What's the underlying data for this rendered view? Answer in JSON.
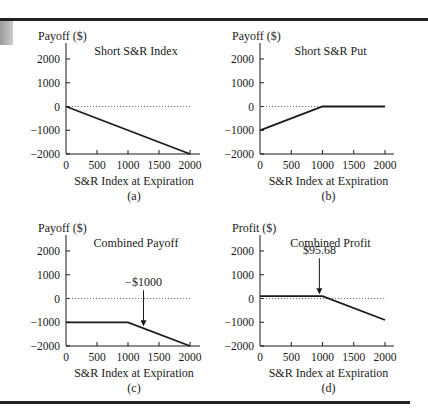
{
  "chart_data": [
    {
      "type": "line",
      "panel_label": "(a)",
      "title": "Short S&R Index",
      "ylabel": "Payoff ($)",
      "xlabel": "S&R Index at Expiration",
      "xlim": [
        0,
        2000
      ],
      "ylim": [
        -2000,
        2000
      ],
      "xticks": [
        0,
        500,
        1000,
        1500,
        2000
      ],
      "yticks": [
        2000,
        1000,
        0,
        -1000,
        -2000
      ],
      "zero_line": "dotted",
      "series": [
        {
          "name": "Short S&R Index",
          "x": [
            0,
            2000
          ],
          "y": [
            0,
            -2000
          ]
        }
      ]
    },
    {
      "type": "line",
      "panel_label": "(b)",
      "title": "Short S&R Put",
      "ylabel": "Payoff ($)",
      "xlabel": "S&R Index at Expiration",
      "xlim": [
        0,
        2000
      ],
      "ylim": [
        -2000,
        2000
      ],
      "xticks": [
        0,
        500,
        1000,
        1500,
        2000
      ],
      "yticks": [
        2000,
        1000,
        0,
        -1000,
        -2000
      ],
      "zero_line": "dotted",
      "series": [
        {
          "name": "Short S&R Put",
          "x": [
            0,
            1000,
            2000
          ],
          "y": [
            -1000,
            0,
            0
          ]
        }
      ]
    },
    {
      "type": "line",
      "panel_label": "(c)",
      "title": "Combined Payoff",
      "ylabel": "Payoff ($)",
      "xlabel": "S&R Index at Expiration",
      "xlim": [
        0,
        2000
      ],
      "ylim": [
        -2000,
        2000
      ],
      "xticks": [
        0,
        500,
        1000,
        1500,
        2000
      ],
      "yticks": [
        2000,
        1000,
        0,
        -1000,
        -2000
      ],
      "zero_line": "dotted",
      "annotations": [
        {
          "text": "−$1000",
          "arrow_to": [
            1250,
            -1250
          ]
        }
      ],
      "series": [
        {
          "name": "Combined Payoff",
          "x": [
            0,
            1000,
            2000
          ],
          "y": [
            -1000,
            -1000,
            -2000
          ]
        }
      ]
    },
    {
      "type": "line",
      "panel_label": "(d)",
      "title": "Combined Profit",
      "ylabel": "Profit ($)",
      "xlabel": "S&R Index at Expiration",
      "xlim": [
        0,
        2000
      ],
      "ylim": [
        -2000,
        2000
      ],
      "xticks": [
        0,
        500,
        1000,
        1500,
        2000
      ],
      "yticks": [
        2000,
        1000,
        0,
        -1000,
        -2000
      ],
      "zero_line": "dotted",
      "annotations": [
        {
          "text": "$95.68",
          "arrow_to": [
            950,
            95.68
          ]
        }
      ],
      "series": [
        {
          "name": "Combined Profit",
          "x": [
            0,
            1000,
            2000
          ],
          "y": [
            95.68,
            95.68,
            -904.32
          ]
        }
      ]
    }
  ],
  "panels": [
    {
      "title": "Short S&R Index",
      "ylabel": "Payoff ($)",
      "xlabel": "S&R Index at Expiration",
      "label": "(a)"
    },
    {
      "title": "Short S&R Put",
      "ylabel": "Payoff ($)",
      "xlabel": "S&R Index at Expiration",
      "label": "(b)"
    },
    {
      "title": "Combined Payoff",
      "ylabel": "Payoff ($)",
      "xlabel": "S&R Index at Expiration",
      "label": "(c)",
      "annotation": "−$1000"
    },
    {
      "title": "Combined Profit",
      "ylabel": "Profit ($)",
      "xlabel": "S&R Index at Expiration",
      "label": "(d)",
      "annotation": "$95.68"
    }
  ],
  "ticks": {
    "x": [
      "0",
      "500",
      "1000",
      "1500",
      "2000"
    ],
    "y": [
      "2000",
      "1000",
      "0",
      "−1000",
      "−2000"
    ]
  }
}
